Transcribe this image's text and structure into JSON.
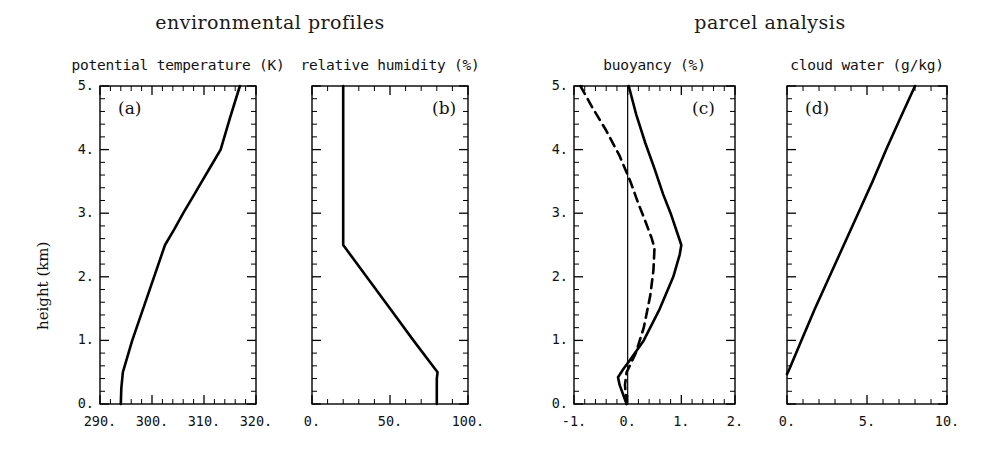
{
  "figure": {
    "groups": [
      {
        "id": "environmental",
        "title": "environmental profiles"
      },
      {
        "id": "parcel",
        "title": "parcel analysis"
      }
    ],
    "y_axis": {
      "label": "height (km)",
      "ticks": [
        "0.",
        "1.",
        "2.",
        "3.",
        "4.",
        "5."
      ],
      "range": [
        0,
        5
      ],
      "minor_per_interval": 5
    },
    "panels": [
      {
        "tag": "(a)",
        "title": "potential temperature (K)",
        "xticks": [
          "290.",
          "300.",
          "310.",
          "320."
        ],
        "xrange": [
          290,
          320
        ],
        "minor_per_interval": 5
      },
      {
        "tag": "(b)",
        "title": "relative humidity (%)",
        "xticks": [
          "0.",
          "50.",
          "100."
        ],
        "xrange": [
          0,
          100
        ],
        "minor_per_interval": 5
      },
      {
        "tag": "(c)",
        "title": "buoyancy (%)",
        "xticks": [
          "-1.",
          "0.",
          "1.",
          "2."
        ],
        "xrange": [
          -1,
          2
        ],
        "minor_per_interval": 5
      },
      {
        "tag": "(d)",
        "title": "cloud water (g/kg)",
        "xticks": [
          "0.",
          "5.",
          "10."
        ],
        "xrange": [
          0,
          10
        ],
        "minor_per_interval": 5
      }
    ]
  },
  "chart_data": [
    {
      "type": "line",
      "panel": "(a)",
      "title": "potential temperature (K)",
      "xlabel": "potential temperature (K)",
      "ylabel": "height (km)",
      "xlim": [
        290,
        320
      ],
      "ylim": [
        0,
        5
      ],
      "xticks": [
        290,
        300,
        310,
        320
      ],
      "yticks": [
        0,
        1,
        2,
        3,
        4,
        5
      ],
      "grid": false,
      "legend": "none",
      "series": [
        {
          "name": "potential temperature",
          "style": "solid",
          "x": [
            294.0,
            294.1,
            294.4,
            296.2,
            298.3,
            300.4,
            302.5,
            304.3,
            306.0,
            307.8,
            309.6,
            311.4,
            313.2,
            315.0,
            316.9
          ],
          "y": [
            0.0,
            0.25,
            0.5,
            1.0,
            1.5,
            2.0,
            2.5,
            2.75,
            3.0,
            3.25,
            3.5,
            3.75,
            4.0,
            4.5,
            5.0
          ]
        }
      ]
    },
    {
      "type": "line",
      "panel": "(b)",
      "title": "relative humidity (%)",
      "xlabel": "relative humidity (%)",
      "ylabel": "height (km)",
      "xlim": [
        0,
        100
      ],
      "ylim": [
        0,
        5
      ],
      "xticks": [
        0,
        50,
        100
      ],
      "yticks": [
        0,
        1,
        2,
        3,
        4,
        5
      ],
      "grid": false,
      "legend": "none",
      "series": [
        {
          "name": "relative humidity",
          "style": "solid",
          "x": [
            80.0,
            80.0,
            80.5,
            65.0,
            50.0,
            35.0,
            20.0,
            20.0,
            20.0,
            20.0
          ],
          "y": [
            0.0,
            0.4,
            0.5,
            1.0,
            1.5,
            2.0,
            2.5,
            3.5,
            4.5,
            5.0
          ]
        }
      ]
    },
    {
      "type": "line",
      "panel": "(c)",
      "title": "buoyancy (%)",
      "xlabel": "buoyancy (%)",
      "ylabel": "height (km)",
      "xlim": [
        -1,
        2
      ],
      "ylim": [
        0,
        5
      ],
      "xticks": [
        -1,
        0,
        1,
        2
      ],
      "yticks": [
        0,
        1,
        2,
        3,
        4,
        5
      ],
      "grid": false,
      "legend": "none",
      "reference_line": {
        "orientation": "vertical",
        "value": 0.0,
        "style": "thin-solid"
      },
      "series": [
        {
          "name": "buoyancy (undilute)",
          "style": "solid",
          "x": [
            -0.02,
            -0.15,
            -0.18,
            -0.08,
            0.05,
            0.3,
            0.6,
            0.85,
            0.97,
            1.0,
            0.92,
            0.8,
            0.66,
            0.5,
            0.33,
            0.16,
            0.02
          ],
          "y": [
            0.0,
            0.3,
            0.42,
            0.55,
            0.7,
            1.0,
            1.5,
            2.0,
            2.35,
            2.5,
            2.7,
            3.0,
            3.3,
            3.7,
            4.1,
            4.55,
            5.0
          ]
        },
        {
          "name": "buoyancy (entraining)",
          "style": "dashed",
          "x": [
            -0.02,
            -0.05,
            -0.02,
            0.05,
            0.15,
            0.3,
            0.42,
            0.48,
            0.5,
            0.45,
            0.34,
            0.2,
            0.05,
            -0.15,
            -0.4,
            -0.65,
            -0.88
          ],
          "y": [
            0.0,
            0.3,
            0.5,
            0.62,
            0.8,
            1.2,
            1.7,
            2.1,
            2.45,
            2.6,
            2.85,
            3.15,
            3.5,
            3.9,
            4.3,
            4.65,
            5.0
          ]
        }
      ]
    },
    {
      "type": "line",
      "panel": "(d)",
      "title": "cloud water (g/kg)",
      "xlabel": "cloud water (g/kg)",
      "ylabel": "height (km)",
      "xlim": [
        0,
        10
      ],
      "ylim": [
        0,
        5
      ],
      "xticks": [
        0,
        5,
        10
      ],
      "yticks": [
        0,
        1,
        2,
        3,
        4,
        5
      ],
      "grid": false,
      "legend": "none",
      "series": [
        {
          "name": "cloud water",
          "style": "solid",
          "x": [
            0.0,
            0.15,
            0.9,
            1.75,
            2.65,
            3.55,
            4.45,
            5.35,
            6.2,
            7.0,
            7.6,
            8.0
          ],
          "y": [
            0.47,
            0.55,
            1.0,
            1.5,
            2.0,
            2.5,
            3.0,
            3.5,
            4.0,
            4.45,
            4.78,
            5.0
          ]
        }
      ]
    }
  ]
}
